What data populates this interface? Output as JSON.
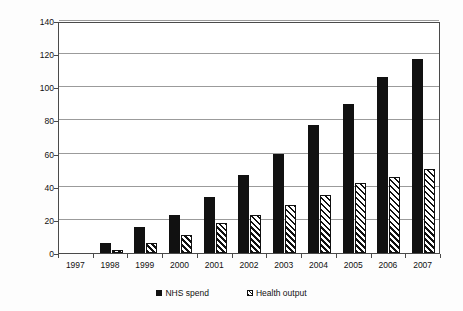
{
  "chart_data": {
    "type": "bar",
    "title": "",
    "xlabel": "",
    "ylabel": "Percentage increase (1997 base)",
    "ylim": [
      0,
      140
    ],
    "ytick_step": 20,
    "yticks": [
      0,
      20,
      40,
      60,
      80,
      100,
      120,
      140
    ],
    "grid": true,
    "categories": [
      "1997",
      "1998",
      "1999",
      "2000",
      "2001",
      "2002",
      "2003",
      "2004",
      "2005",
      "2006",
      "2007"
    ],
    "legend_position": "bottom",
    "series": [
      {
        "name": "NHS spend",
        "style": "solid-black",
        "color": "#111111",
        "values": [
          0,
          6,
          16,
          23,
          34,
          47,
          60,
          77,
          90,
          106,
          117
        ]
      },
      {
        "name": "Health output",
        "style": "diagonal-hatch",
        "color": "#111111",
        "values": [
          0,
          2,
          6,
          11,
          18,
          23,
          29,
          35,
          42,
          46,
          51
        ]
      }
    ]
  },
  "legend": {
    "items": [
      {
        "label": "NHS spend"
      },
      {
        "label": "Health output"
      }
    ]
  },
  "axis": {
    "y_title": "Percentage increase (1997 base)"
  }
}
